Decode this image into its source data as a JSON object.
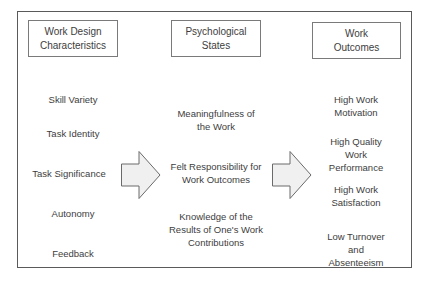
{
  "diagram": {
    "columns": [
      {
        "header": "Work Design\nCharacteristics",
        "items": [
          "Skill Variety",
          "Task Identity",
          "Task Significance",
          "Autonomy",
          "Feedback"
        ]
      },
      {
        "header": "Psychological\nStates",
        "items": [
          "Meaningfulness of\nthe Work",
          "Felt Responsibility for\nWork Outcomes",
          "Knowledge of the\nResults of One's Work\nContributions"
        ]
      },
      {
        "header": "Work\nOutcomes",
        "items": [
          "High Work\nMotivation",
          "High Quality Work\nPerformance",
          "High Work\nSatisfaction",
          "Low Turnover and\nAbsenteeism"
        ]
      }
    ],
    "arrows": [
      {
        "from": "Work Design Characteristics",
        "to": "Psychological States"
      },
      {
        "from": "Psychological States",
        "to": "Work Outcomes"
      }
    ],
    "colors": {
      "border": "#5a5a5a",
      "arrow_fill": "#f0f0f0",
      "arrow_stroke": "#6a6a6a",
      "text": "#3d3d3d"
    }
  }
}
